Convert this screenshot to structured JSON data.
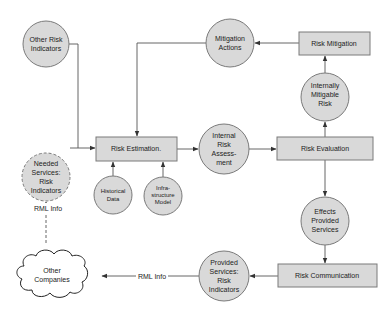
{
  "diagram": {
    "type": "risk-management-flow",
    "nodes": {
      "other_risk_indicators": {
        "shape": "circle",
        "lines": [
          "Other Risk",
          "Indicators"
        ]
      },
      "mitigation_actions": {
        "shape": "circle",
        "lines": [
          "Mitigation",
          "Actions"
        ]
      },
      "risk_mitigation": {
        "shape": "box",
        "label": "Risk Mitigation"
      },
      "internally_mitigable_risk": {
        "shape": "circle",
        "lines": [
          "Internally",
          "Mitigable",
          "Risk"
        ]
      },
      "needed_services": {
        "shape": "dashed-circle",
        "lines": [
          "Needed",
          "Services:",
          "Risk",
          "Indicators"
        ]
      },
      "risk_estimation": {
        "shape": "box",
        "label": "Risk Estimation."
      },
      "internal_risk_assessment": {
        "shape": "circle",
        "lines": [
          "Internal",
          "Risk",
          "Assess-",
          "ment"
        ]
      },
      "risk_evaluation": {
        "shape": "box",
        "label": "Risk Evaluation"
      },
      "historical_data": {
        "shape": "circle",
        "lines": [
          "Historical",
          "Data"
        ]
      },
      "infrastructure_model": {
        "shape": "circle",
        "lines": [
          "Infra-",
          "structure",
          "Model"
        ]
      },
      "effects_provided_services": {
        "shape": "circle",
        "lines": [
          "Effects",
          "Provided",
          "Services"
        ]
      },
      "risk_communication": {
        "shape": "box",
        "label": "Risk Communication"
      },
      "provided_services": {
        "shape": "circle",
        "lines": [
          "Provided",
          "Services:",
          "Risk",
          "Indicators"
        ]
      },
      "other_companies": {
        "shape": "cloud",
        "lines": [
          "Other",
          "Companies"
        ]
      }
    },
    "edge_labels": {
      "rml_info_vertical": "RML Info",
      "rml_info_horizontal": "RML Info"
    },
    "edges": [
      {
        "from": "other_risk_indicators",
        "to": "risk_estimation"
      },
      {
        "from": "needed_services",
        "to": "risk_estimation"
      },
      {
        "from": "mitigation_actions",
        "to": "risk_estimation"
      },
      {
        "from": "historical_data",
        "to": "risk_estimation"
      },
      {
        "from": "infrastructure_model",
        "to": "risk_estimation"
      },
      {
        "from": "risk_estimation",
        "to": "internal_risk_assessment"
      },
      {
        "from": "internal_risk_assessment",
        "to": "risk_evaluation"
      },
      {
        "from": "risk_evaluation",
        "to": "internally_mitigable_risk"
      },
      {
        "from": "internally_mitigable_risk",
        "to": "risk_mitigation"
      },
      {
        "from": "risk_mitigation",
        "to": "mitigation_actions"
      },
      {
        "from": "risk_evaluation",
        "to": "effects_provided_services"
      },
      {
        "from": "effects_provided_services",
        "to": "risk_communication"
      },
      {
        "from": "risk_communication",
        "to": "provided_services"
      },
      {
        "from": "provided_services",
        "to": "other_companies",
        "label": "RML Info"
      },
      {
        "from": "other_companies",
        "to": "needed_services",
        "label": "RML Info",
        "style": "dashed"
      }
    ]
  }
}
